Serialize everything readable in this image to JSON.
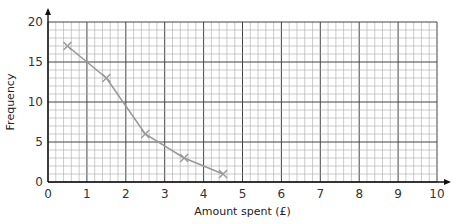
{
  "chart_data": {
    "type": "line",
    "title": "",
    "xlabel": "Amount spent (£)",
    "ylabel": "Frequency",
    "xlim": [
      0,
      10
    ],
    "ylim": [
      0,
      20
    ],
    "x_ticks": [
      "0",
      "1",
      "2",
      "3",
      "4",
      "5",
      "6",
      "7",
      "8",
      "9",
      "10"
    ],
    "y_ticks": [
      "0",
      "5",
      "10",
      "15",
      "20"
    ],
    "grid": true,
    "marker": "x",
    "line_color": "#999999",
    "series": [
      {
        "name": "Frequency polygon",
        "x": [
          0.5,
          1.5,
          2.5,
          3.5,
          4.5
        ],
        "values": [
          17,
          13,
          6,
          3,
          1
        ]
      }
    ]
  }
}
